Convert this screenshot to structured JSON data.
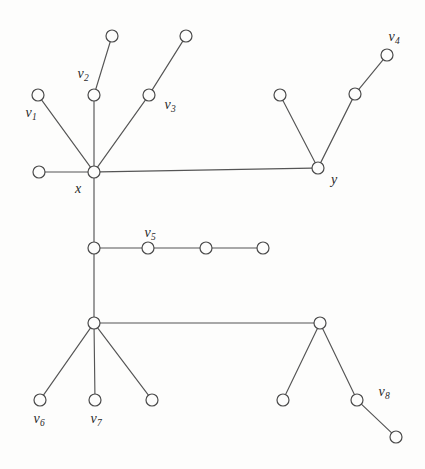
{
  "figure": {
    "type": "undirected-graph-diagram",
    "title": "",
    "background_color": "#fdfdfc",
    "edge_color": "#555555",
    "node_stroke_color": "#4a4a4a",
    "node_fill_color": "#fdfdfc",
    "node_radius": 6,
    "width": 425,
    "height": 469
  },
  "nodes": [
    {
      "id": "n_leaf_v2_top",
      "cx": 112,
      "cy": 36,
      "label": "",
      "sub": ""
    },
    {
      "id": "n_leaf_v3_top",
      "cx": 186,
      "cy": 36,
      "label": "",
      "sub": ""
    },
    {
      "id": "n_v4",
      "cx": 387,
      "cy": 55,
      "label": "v",
      "sub": "4"
    },
    {
      "id": "n_v1",
      "cx": 38,
      "cy": 95,
      "label": "v",
      "sub": "1"
    },
    {
      "id": "n_v2",
      "cx": 94,
      "cy": 95,
      "label": "v",
      "sub": "2"
    },
    {
      "id": "n_v3",
      "cx": 149,
      "cy": 95,
      "label": "v",
      "sub": "3"
    },
    {
      "id": "n_y_leaf_left",
      "cx": 280,
      "cy": 95,
      "label": "",
      "sub": ""
    },
    {
      "id": "n_y_mid_right",
      "cx": 355,
      "cy": 94,
      "label": "",
      "sub": ""
    },
    {
      "id": "n_x_leaf_left",
      "cx": 39,
      "cy": 172,
      "label": "",
      "sub": ""
    },
    {
      "id": "n_x",
      "cx": 94,
      "cy": 172,
      "label": "x",
      "sub": ""
    },
    {
      "id": "n_y",
      "cx": 318,
      "cy": 168,
      "label": "y",
      "sub": ""
    },
    {
      "id": "n_mid_junction",
      "cx": 94,
      "cy": 248,
      "label": "",
      "sub": ""
    },
    {
      "id": "n_v5",
      "cx": 148,
      "cy": 248,
      "label": "v",
      "sub": "5"
    },
    {
      "id": "n_chain_c",
      "cx": 206,
      "cy": 248,
      "label": "",
      "sub": ""
    },
    {
      "id": "n_chain_d",
      "cx": 263,
      "cy": 248,
      "label": "",
      "sub": ""
    },
    {
      "id": "n_low_junction",
      "cx": 94,
      "cy": 323,
      "label": "",
      "sub": ""
    },
    {
      "id": "n_low_right",
      "cx": 320,
      "cy": 323,
      "label": "",
      "sub": ""
    },
    {
      "id": "n_v6",
      "cx": 40,
      "cy": 400,
      "label": "v",
      "sub": "6"
    },
    {
      "id": "n_v7",
      "cx": 95,
      "cy": 400,
      "label": "v",
      "sub": "7"
    },
    {
      "id": "n_low_leaf_3",
      "cx": 152,
      "cy": 400,
      "label": "",
      "sub": ""
    },
    {
      "id": "n_lr_leaf_left",
      "cx": 283,
      "cy": 400,
      "label": "",
      "sub": ""
    },
    {
      "id": "n_v8",
      "cx": 357,
      "cy": 400,
      "label": "v",
      "sub": "8"
    },
    {
      "id": "n_v8_child",
      "cx": 396,
      "cy": 437,
      "label": "",
      "sub": ""
    }
  ],
  "edges": [
    {
      "from": "n_v2",
      "to": "n_leaf_v2_top"
    },
    {
      "from": "n_v3",
      "to": "n_leaf_v3_top"
    },
    {
      "from": "n_v1",
      "to": "n_x"
    },
    {
      "from": "n_v2",
      "to": "n_x"
    },
    {
      "from": "n_v3",
      "to": "n_x"
    },
    {
      "from": "n_x_leaf_left",
      "to": "n_x"
    },
    {
      "from": "n_x",
      "to": "n_y"
    },
    {
      "from": "n_y",
      "to": "n_y_leaf_left"
    },
    {
      "from": "n_y",
      "to": "n_y_mid_right"
    },
    {
      "from": "n_y_mid_right",
      "to": "n_v4"
    },
    {
      "from": "n_x",
      "to": "n_mid_junction"
    },
    {
      "from": "n_mid_junction",
      "to": "n_v5"
    },
    {
      "from": "n_v5",
      "to": "n_chain_c"
    },
    {
      "from": "n_chain_c",
      "to": "n_chain_d"
    },
    {
      "from": "n_mid_junction",
      "to": "n_low_junction"
    },
    {
      "from": "n_low_junction",
      "to": "n_low_right"
    },
    {
      "from": "n_low_junction",
      "to": "n_v6"
    },
    {
      "from": "n_low_junction",
      "to": "n_v7"
    },
    {
      "from": "n_low_junction",
      "to": "n_low_leaf_3"
    },
    {
      "from": "n_low_right",
      "to": "n_lr_leaf_left"
    },
    {
      "from": "n_low_right",
      "to": "n_v8"
    },
    {
      "from": "n_v8",
      "to": "n_v8_child"
    }
  ],
  "labels": [
    {
      "id": "lbl_v1",
      "text": "v",
      "sub": "1",
      "x": 31,
      "y": 113
    },
    {
      "id": "lbl_v2",
      "text": "v",
      "sub": "2",
      "x": 83,
      "y": 74
    },
    {
      "id": "lbl_v3",
      "text": "v",
      "sub": "3",
      "x": 170,
      "y": 105
    },
    {
      "id": "lbl_v4",
      "text": "v",
      "sub": "4",
      "x": 394,
      "y": 37
    },
    {
      "id": "lbl_v5",
      "text": "v",
      "sub": "5",
      "x": 150,
      "y": 233
    },
    {
      "id": "lbl_v6",
      "text": "v",
      "sub": "6",
      "x": 39,
      "y": 419
    },
    {
      "id": "lbl_v7",
      "text": "v",
      "sub": "7",
      "x": 96,
      "y": 419
    },
    {
      "id": "lbl_v8",
      "text": "v",
      "sub": "8",
      "x": 384,
      "y": 392
    },
    {
      "id": "lbl_x",
      "text": "x",
      "sub": "",
      "x": 78,
      "y": 189
    },
    {
      "id": "lbl_y",
      "text": "y",
      "sub": "",
      "x": 334,
      "y": 180
    }
  ]
}
